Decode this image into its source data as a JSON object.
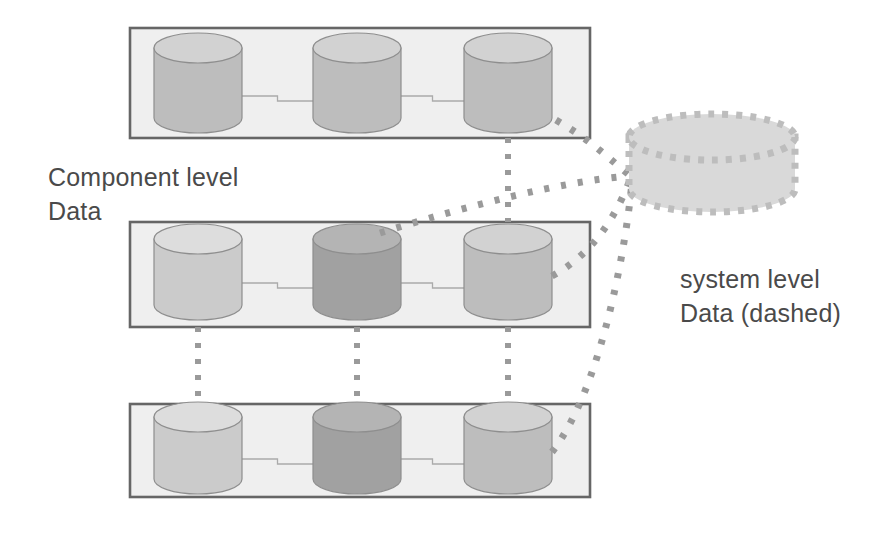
{
  "diagram": {
    "labels": {
      "component_level": "Component level\nData",
      "system_level": "system level\nData (dashed)"
    },
    "colors": {
      "group_box_fill": "#efefef",
      "group_box_stroke": "#666666",
      "cylinder_light": "#cbcbcb",
      "cylinder_light_top": "#dddddd",
      "cylinder_medium": "#bdbdbd",
      "cylinder_medium_top": "#d2d2d2",
      "cylinder_dark": "#a1a1a1",
      "cylinder_dark_top": "#b4b4b4",
      "cylinder_stroke": "#8e8e8e",
      "dashed_fill": "#d9d9d9",
      "dashed_stroke": "#bdbdbd",
      "connector_line": "#aaaaaa",
      "dotted_link": "#9a9a9a",
      "text": "#4a4a4a",
      "background": "#ffffff"
    },
    "groups": [
      {
        "name": "component-group-top",
        "x": 130,
        "y": 28,
        "width": 460,
        "height": 110,
        "cylinders": [
          {
            "name": "cylinder-top-1",
            "cx": 198,
            "cy": 83,
            "rx": 44,
            "ry": 15,
            "body": 70,
            "shade": "medium"
          },
          {
            "name": "cylinder-top-2",
            "cx": 357,
            "cy": 83,
            "rx": 44,
            "ry": 15,
            "body": 70,
            "shade": "medium"
          },
          {
            "name": "cylinder-top-3",
            "cx": 508,
            "cy": 83,
            "rx": 44,
            "ry": 15,
            "body": 70,
            "shade": "medium"
          }
        ]
      },
      {
        "name": "component-group-middle",
        "x": 130,
        "y": 222,
        "width": 460,
        "height": 105,
        "cylinders": [
          {
            "name": "cylinder-middle-1",
            "cx": 198,
            "cy": 272,
            "rx": 44,
            "ry": 15,
            "body": 66,
            "shade": "light"
          },
          {
            "name": "cylinder-middle-2",
            "cx": 357,
            "cy": 272,
            "rx": 44,
            "ry": 15,
            "body": 66,
            "shade": "dark"
          },
          {
            "name": "cylinder-middle-3",
            "cx": 508,
            "cy": 272,
            "rx": 44,
            "ry": 15,
            "body": 66,
            "shade": "medium"
          }
        ]
      },
      {
        "name": "component-group-bottom",
        "x": 130,
        "y": 404,
        "width": 460,
        "height": 93,
        "cylinders": [
          {
            "name": "cylinder-bottom-1",
            "cx": 198,
            "cy": 448,
            "rx": 44,
            "ry": 15,
            "body": 62,
            "shade": "light"
          },
          {
            "name": "cylinder-bottom-2",
            "cx": 357,
            "cy": 448,
            "rx": 44,
            "ry": 15,
            "body": 62,
            "shade": "dark"
          },
          {
            "name": "cylinder-bottom-3",
            "cx": 508,
            "cy": 448,
            "rx": 44,
            "ry": 15,
            "body": 62,
            "shade": "medium"
          }
        ]
      }
    ],
    "system_cylinder": {
      "name": "system-level-cylinder",
      "cx": 712,
      "cy": 163,
      "rx": 83,
      "ry": 23,
      "body": 52,
      "style": "dashed"
    },
    "intra_connectors": [
      {
        "name": "connector-top-1-2",
        "x1": 242,
        "y1": 96,
        "x2": 313,
        "y2": 101
      },
      {
        "name": "connector-top-2-3",
        "x1": 401,
        "y1": 96,
        "x2": 464,
        "y2": 101
      },
      {
        "name": "connector-middle-1-2",
        "x1": 242,
        "y1": 283,
        "x2": 313,
        "y2": 288
      },
      {
        "name": "connector-middle-2-3",
        "x1": 401,
        "y1": 283,
        "x2": 464,
        "y2": 288
      },
      {
        "name": "connector-bottom-1-2",
        "x1": 242,
        "y1": 459,
        "x2": 313,
        "y2": 464
      },
      {
        "name": "connector-bottom-2-3",
        "x1": 401,
        "y1": 459,
        "x2": 464,
        "y2": 464
      }
    ],
    "vertical_links": [
      {
        "name": "vlink-column-1-middle-bottom",
        "x1": 198,
        "y1": 327,
        "x2": 198,
        "y2": 404
      },
      {
        "name": "vlink-column-2-middle-bottom",
        "x1": 357,
        "y1": 327,
        "x2": 357,
        "y2": 404
      },
      {
        "name": "vlink-column-3-middle-bottom",
        "x1": 508,
        "y1": 327,
        "x2": 508,
        "y2": 404
      },
      {
        "name": "vlink-column-3-top-middle",
        "x1": 508,
        "y1": 138,
        "x2": 508,
        "y2": 222
      }
    ],
    "system_links": [
      {
        "name": "slink-top-row-to-system",
        "d": "M 556,120 C 590,140 605,155 628,174"
      },
      {
        "name": "slink-middle-row-top-to-system",
        "d": "M 380,233 C 470,205 560,182 628,176"
      },
      {
        "name": "slink-middle-row-right-to-system",
        "d": "M 552,276 C 600,250 620,205 630,180"
      },
      {
        "name": "slink-bottom-row-right-to-system",
        "d": "M 552,452 C 600,390 625,255 632,182"
      }
    ]
  }
}
